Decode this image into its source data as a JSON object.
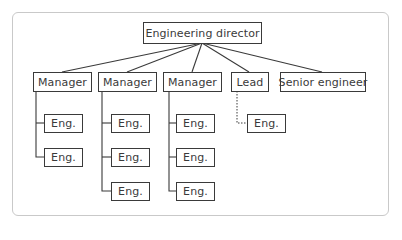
{
  "diagram": {
    "type": "org-chart",
    "colors": {
      "line": "#3a3a3a",
      "frame": "#c9c9c9",
      "text": "#3a3a3a",
      "background": "#ffffff"
    },
    "root": {
      "label": "Engineering director"
    },
    "level1": [
      {
        "label": "Manager",
        "reports": [
          "Eng.",
          "Eng."
        ]
      },
      {
        "label": "Manager",
        "reports": [
          "Eng.",
          "Eng.",
          "Eng."
        ]
      },
      {
        "label": "Manager",
        "reports": [
          "Eng.",
          "Eng.",
          "Eng."
        ]
      },
      {
        "label": "Lead",
        "reports": [
          "Eng."
        ],
        "report_link_style": "dotted"
      },
      {
        "label": "Senior engineer",
        "reports": []
      }
    ]
  }
}
